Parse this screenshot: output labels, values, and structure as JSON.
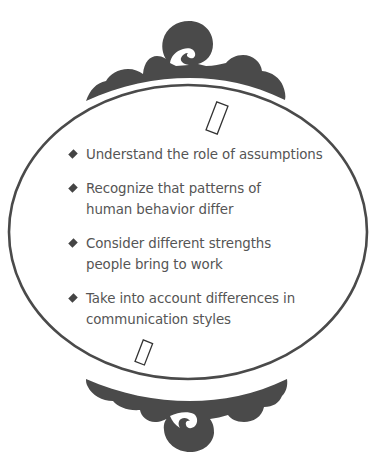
{
  "colors": {
    "ornament": "#4a4a4a",
    "frame_stroke": "#4a4a4a",
    "text": "#555555",
    "bullet": "#444444",
    "background": "#ffffff"
  },
  "frame": {
    "shape": "ellipse",
    "top_ornament": "scroll-swirl",
    "bottom_ornament": "scroll-swirl",
    "markers": [
      "empty-rectangle",
      "empty-rectangle"
    ]
  },
  "bullets": [
    {
      "icon": "diamond",
      "lines": [
        "Understand the role of assumptions"
      ]
    },
    {
      "icon": "diamond",
      "lines": [
        "Recognize that patterns of",
        "human behavior differ"
      ]
    },
    {
      "icon": "diamond",
      "lines": [
        "Consider different strengths",
        "people bring to work"
      ]
    },
    {
      "icon": "diamond",
      "lines": [
        "Take into account differences in",
        "communication styles"
      ]
    }
  ]
}
